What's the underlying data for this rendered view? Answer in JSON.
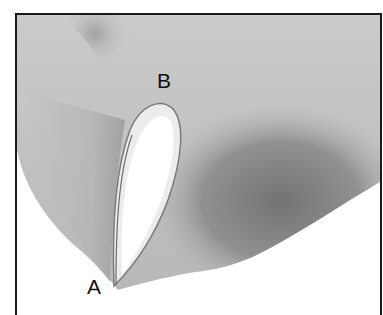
{
  "figure": {
    "labels": [
      {
        "id": "A",
        "text": "A"
      },
      {
        "id": "B",
        "text": "B"
      }
    ],
    "colors": {
      "frame": "#1a1a1a",
      "background": "#ffffff",
      "light_shade": "#cfcfcf",
      "mid_shade": "#a9a9a9",
      "dark_shade": "#7c7c7c",
      "opening": "#ffffff"
    }
  }
}
